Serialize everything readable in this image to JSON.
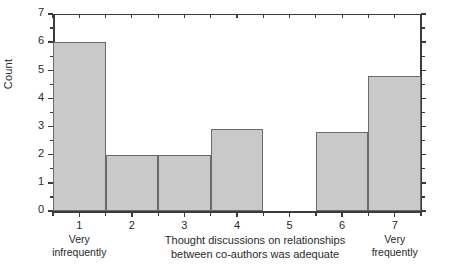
{
  "chart_data": {
    "type": "bar",
    "title": "",
    "subtitle": "",
    "xlabel_line1": "Thought discussions on relationships",
    "xlabel_line2": "between co-authors was adequate",
    "ylabel": "Count",
    "categories": [
      "1",
      "2",
      "3",
      "4",
      "5",
      "6",
      "7"
    ],
    "category_sublabels": [
      "Very\ninfrequently",
      "",
      "",
      "",
      "",
      "",
      "Very\nfrequently"
    ],
    "values": [
      6,
      2,
      2,
      2.9,
      0,
      2.8,
      4.8
    ],
    "xlim": [
      0.5,
      7.5
    ],
    "ylim": [
      0,
      7
    ],
    "yticks": [
      0,
      1,
      2,
      3,
      4,
      5,
      6,
      7
    ],
    "ytick_labels": [
      "0",
      "1",
      "2",
      "3",
      "4",
      "5",
      "6",
      "7"
    ],
    "grid": false,
    "legend": null,
    "bar_fill_color": "#c9c9c9",
    "bar_edge_color": "#6b6b6b",
    "axis_color": "#3b3b3b",
    "background_color": "#ffffff",
    "bar_style": "histogram-contiguous"
  },
  "labels": {
    "cat1_sub_line1": "Very",
    "cat1_sub_line2": "infrequently",
    "cat7_sub_line1": "Very",
    "cat7_sub_line2": "frequently"
  }
}
